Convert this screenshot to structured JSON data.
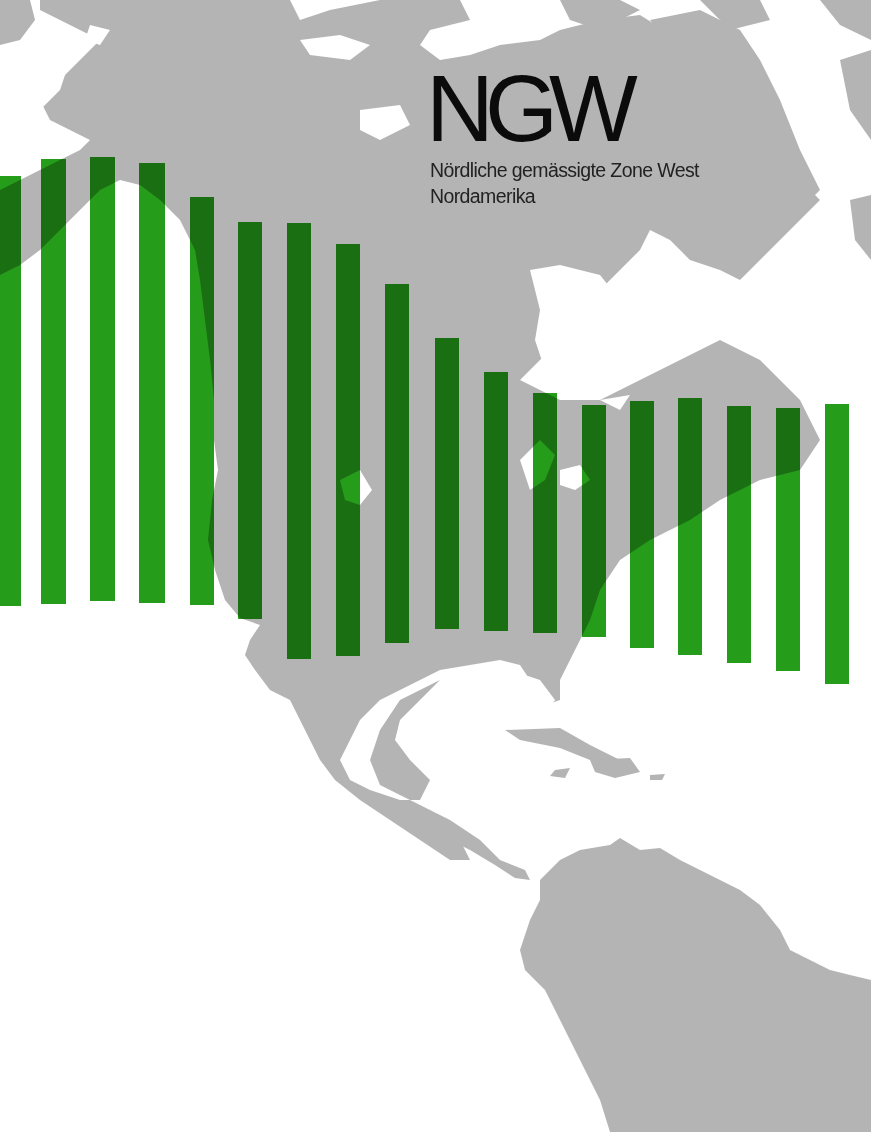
{
  "title": "NGW",
  "subtitle_line1": "Nördliche gemässigte Zone West",
  "subtitle_line2": "Nordamerika",
  "colors": {
    "bar": "#1e9a12",
    "bar_over_land": "#0a6a0a",
    "land": "#b4b4b4",
    "water": "#ffffff",
    "text": "#0b0b0b"
  },
  "chart_data": {
    "type": "bar",
    "xlabel": "",
    "ylabel": "",
    "grid": false,
    "legend": "none",
    "note": "Floating vertical bars (pixel top/bottom) overlaid on a gray map of the Americas; no axes or tick labels shown.",
    "categories": [
      "1",
      "2",
      "3",
      "4",
      "5",
      "6",
      "7",
      "8",
      "9",
      "10",
      "11",
      "12",
      "13",
      "14",
      "15",
      "16",
      "17",
      "18"
    ],
    "bars": [
      {
        "x": 0,
        "w": 21,
        "top": 176,
        "bottom": 606
      },
      {
        "x": 41,
        "w": 25,
        "top": 159,
        "bottom": 604
      },
      {
        "x": 90,
        "w": 25,
        "top": 157,
        "bottom": 601
      },
      {
        "x": 139,
        "w": 26,
        "top": 163,
        "bottom": 603
      },
      {
        "x": 190,
        "w": 24,
        "top": 197,
        "bottom": 605
      },
      {
        "x": 238,
        "w": 24,
        "top": 222,
        "bottom": 619
      },
      {
        "x": 287,
        "w": 24,
        "top": 223,
        "bottom": 659
      },
      {
        "x": 336,
        "w": 24,
        "top": 244,
        "bottom": 656
      },
      {
        "x": 385,
        "w": 24,
        "top": 284,
        "bottom": 643
      },
      {
        "x": 435,
        "w": 24,
        "top": 338,
        "bottom": 629
      },
      {
        "x": 484,
        "w": 24,
        "top": 372,
        "bottom": 631
      },
      {
        "x": 533,
        "w": 24,
        "top": 393,
        "bottom": 633
      },
      {
        "x": 582,
        "w": 24,
        "top": 405,
        "bottom": 637
      },
      {
        "x": 630,
        "w": 24,
        "top": 401,
        "bottom": 648
      },
      {
        "x": 678,
        "w": 24,
        "top": 398,
        "bottom": 655
      },
      {
        "x": 727,
        "w": 24,
        "top": 406,
        "bottom": 663
      },
      {
        "x": 776,
        "w": 24,
        "top": 408,
        "bottom": 671
      },
      {
        "x": 825,
        "w": 24,
        "top": 404,
        "bottom": 684
      }
    ],
    "values": [
      430,
      445,
      444,
      440,
      408,
      397,
      436,
      412,
      359,
      291,
      259,
      240,
      232,
      247,
      257,
      257,
      263,
      280
    ]
  }
}
